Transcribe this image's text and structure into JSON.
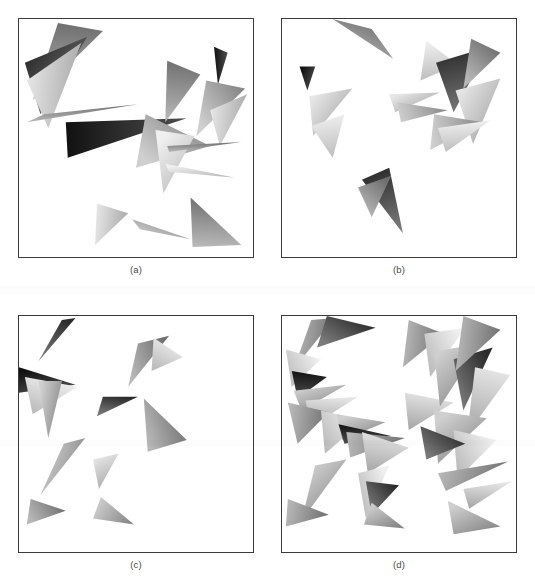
{
  "figure": {
    "type": "multi-panel-figure",
    "background_color": "#ffffff",
    "frame_color": "#3a3a3a",
    "caption_color": "#4a4a4a",
    "width": 535,
    "height": 588,
    "panels": [
      {
        "id": "panel-a",
        "caption": "(a)",
        "frame": {
          "x": 18,
          "y": 18,
          "w": 236,
          "h": 240
        },
        "caption_pos": {
          "x": 18,
          "y": 264,
          "w": 236
        },
        "triangle_count": 15,
        "triangles": [
          {
            "points": "40,4 86,12 14,82",
            "g": "g-mid",
            "rot": 0
          },
          {
            "points": "6,44 70,18 22,96",
            "g": "g-dark",
            "rot": 0
          },
          {
            "points": "8,62 64,24 30,110",
            "g": "g-light",
            "rot": 0
          },
          {
            "points": "26,96 122,86 8,104",
            "g": "g-mid",
            "rot": 0
          },
          {
            "points": "48,104 172,100 50,140",
            "g": "g-vdark",
            "rot": 0
          },
          {
            "points": "130,96 196,128 120,150",
            "g": "g-mid2",
            "rot": 0
          },
          {
            "points": "140,112 180,118 148,176",
            "g": "g-light2",
            "rot": 0
          },
          {
            "points": "152,42 186,56 150,104",
            "g": "g-mid",
            "rot": 0
          },
          {
            "points": "200,28 214,34 204,66",
            "g": "g-vdark",
            "rot": 0
          },
          {
            "points": "192,62 232,70 182,118",
            "g": "g-mid2",
            "rot": 0
          },
          {
            "points": "196,92 234,76 206,128",
            "g": "g-light",
            "rot": 0
          },
          {
            "points": "152,128 228,124 154,134",
            "g": "g-mid",
            "rot": 0
          },
          {
            "points": "150,146 222,160 154,154",
            "g": "g-light2",
            "rot": 0
          },
          {
            "points": "80,186 112,196 78,228",
            "g": "g-light",
            "rot": 0
          },
          {
            "points": "116,202 176,222 124,212",
            "g": "g-mid2",
            "rot": 0
          },
          {
            "points": "176,180 228,228 178,230",
            "g": "g-mid",
            "rot": 0
          }
        ]
      },
      {
        "id": "panel-b",
        "caption": "(b)",
        "frame": {
          "x": 281,
          "y": 18,
          "w": 236,
          "h": 240
        },
        "caption_pos": {
          "x": 281,
          "y": 264,
          "w": 236
        },
        "triangle_count": 14,
        "triangles": [
          {
            "points": "52,0 92,10 114,40",
            "g": "g-mid",
            "rot": 0
          },
          {
            "points": "18,48 34,48 26,72",
            "g": "g-vdark",
            "rot": 0
          },
          {
            "points": "28,78 72,70 32,118",
            "g": "g-light",
            "rot": 0
          },
          {
            "points": "30,108 64,96 52,140",
            "g": "g-light2",
            "rot": 0
          },
          {
            "points": "110,76 162,74 116,94",
            "g": "g-light",
            "rot": 0
          },
          {
            "points": "118,84 170,92 122,104",
            "g": "g-mid2",
            "rot": 0
          },
          {
            "points": "148,22 180,46 142,62",
            "g": "g-light2",
            "rot": 0
          },
          {
            "points": "158,44 212,28 176,94",
            "g": "g-dark",
            "rot": 0
          },
          {
            "points": "194,20 224,34 186,70",
            "g": "g-mid",
            "rot": 0
          },
          {
            "points": "178,72 224,60 196,126",
            "g": "g-light",
            "rot": 0
          },
          {
            "points": "156,96 206,104 152,132",
            "g": "g-mid2",
            "rot": 0
          },
          {
            "points": "160,110 214,102 168,134",
            "g": "g-light2",
            "rot": 0
          },
          {
            "points": "82,162 110,150 124,216",
            "g": "g-dark",
            "rot": 0
          },
          {
            "points": "78,170 112,158 92,200",
            "g": "g-mid",
            "rot": 0
          }
        ]
      },
      {
        "id": "panel-c",
        "caption": "(c)",
        "frame": {
          "x": 18,
          "y": 315,
          "w": 236,
          "h": 238
        },
        "caption_pos": {
          "x": 18,
          "y": 559,
          "w": 236
        },
        "triangle_count": 12,
        "triangles": [
          {
            "points": "44,4 58,2 20,46",
            "g": "g-dark",
            "rot": 0
          },
          {
            "points": "0,52 58,70 0,78",
            "g": "g-vdark",
            "rot": 0
          },
          {
            "points": "6,62 60,72 14,100",
            "g": "g-light2",
            "rot": 0
          },
          {
            "points": "20,66 44,66 30,124",
            "g": "g-mid2",
            "rot": 0
          },
          {
            "points": "122,28 154,20 112,72",
            "g": "g-mid",
            "rot": 0
          },
          {
            "points": "138,22 168,42 136,56",
            "g": "g-light2",
            "rot": 0
          },
          {
            "points": "86,82 122,82 80,102",
            "g": "g-dark",
            "rot": 0
          },
          {
            "points": "128,84 172,126 132,138",
            "g": "g-mid",
            "rot": 0
          },
          {
            "points": "46,130 68,124 22,182",
            "g": "g-mid2",
            "rot": 0
          },
          {
            "points": "76,146 102,140 82,176",
            "g": "g-light",
            "rot": 0
          },
          {
            "points": "12,186 48,198 8,212",
            "g": "g-mid",
            "rot": 0
          },
          {
            "points": "84,184 118,212 76,206",
            "g": "g-mid2",
            "rot": 0
          }
        ]
      },
      {
        "id": "panel-d",
        "caption": "(d)",
        "frame": {
          "x": 281,
          "y": 315,
          "w": 236,
          "h": 238
        },
        "caption_pos": {
          "x": 281,
          "y": 559,
          "w": 236
        },
        "triangle_count": 30,
        "triangles": [
          {
            "points": "30,4 54,2 12,54",
            "g": "g-mid",
            "rot": 0
          },
          {
            "points": "46,0 96,12 36,32",
            "g": "g-dark",
            "rot": 0
          },
          {
            "points": "4,34 40,44 10,72",
            "g": "g-light2",
            "rot": 0
          },
          {
            "points": "10,56 46,62 16,84",
            "g": "g-vdark",
            "rot": 0
          },
          {
            "points": "12,76 66,70 20,96",
            "g": "g-mid2",
            "rot": 0
          },
          {
            "points": "24,86 78,82 30,112",
            "g": "g-light",
            "rot": 0
          },
          {
            "points": "6,88 48,98 16,130",
            "g": "g-mid",
            "rot": 0
          },
          {
            "points": "40,96 84,106 44,140",
            "g": "g-light2",
            "rot": 0
          },
          {
            "points": "56,100 106,108 62,126",
            "g": "g-mid2",
            "rot": 0
          },
          {
            "points": "58,110 112,122 64,130",
            "g": "g-vdark",
            "rot": 0
          },
          {
            "points": "66,118 126,124 70,144",
            "g": "g-mid",
            "rot": 0
          },
          {
            "points": "82,118 130,134 88,160",
            "g": "g-light",
            "rot": 0
          },
          {
            "points": "34,152 66,146 20,208",
            "g": "g-mid2",
            "rot": 0
          },
          {
            "points": "78,160 110,152 86,206",
            "g": "g-light2",
            "rot": 0
          },
          {
            "points": "86,168 120,172 92,202",
            "g": "g-dark",
            "rot": 0
          },
          {
            "points": "6,186 48,202 4,214",
            "g": "g-mid",
            "rot": 0
          },
          {
            "points": "92,190 126,216 84,212",
            "g": "g-mid2",
            "rot": 0
          },
          {
            "points": "126,78 176,88 130,116",
            "g": "g-light"
          },
          {
            "points": "130,4 166,18 124,52",
            "g": "g-mid"
          },
          {
            "points": "146,18 188,12 152,62",
            "g": "g-light2"
          },
          {
            "points": "156,36 204,28 162,92",
            "g": "g-mid2"
          },
          {
            "points": "176,44 216,32 186,96",
            "g": "g-dark"
          },
          {
            "points": "186,0 224,14 178,56",
            "g": "g-mid"
          },
          {
            "points": "198,52 234,60 190,120",
            "g": "g-light"
          },
          {
            "points": "156,96 210,104 160,150",
            "g": "g-mid2"
          },
          {
            "points": "176,116 220,126 180,166",
            "g": "g-light2"
          },
          {
            "points": "142,112 188,130 148,146",
            "g": "g-dark"
          },
          {
            "points": "160,160 232,148 168,178",
            "g": "g-mid"
          },
          {
            "points": "186,176 236,168 192,196",
            "g": "g-light"
          },
          {
            "points": "170,188 224,214 176,222",
            "g": "g-mid2"
          }
        ]
      }
    ],
    "gradients": [
      {
        "id": "g-vdark",
        "from": "#111111",
        "to": "#4e4e4e"
      },
      {
        "id": "g-dark",
        "from": "#2b2b2b",
        "to": "#7a7a7a"
      },
      {
        "id": "g-mid",
        "from": "#6f6f6f",
        "to": "#b8b8b8"
      },
      {
        "id": "g-mid2",
        "from": "#8a8a8a",
        "to": "#cfcfcf"
      },
      {
        "id": "g-light",
        "from": "#a8a8a8",
        "to": "#e6e6e6"
      },
      {
        "id": "g-light2",
        "from": "#bdbdbd",
        "to": "#f0f0f0"
      }
    ]
  }
}
